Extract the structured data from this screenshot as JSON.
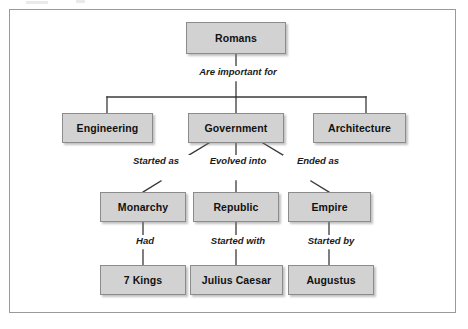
{
  "diagram": {
    "type": "concept-map",
    "title_node": "Romans",
    "frame": {
      "visible": true,
      "border_color": "#9a9a9a"
    },
    "style": {
      "node_fill": "#d2d2d2",
      "node_border": "#8b8b8b",
      "text_color": "#111111",
      "line_color": "#3a3a3a",
      "background": "#ffffff"
    },
    "nodes": [
      {
        "id": "romans",
        "label": "Romans",
        "level": 0
      },
      {
        "id": "engineering",
        "label": "Engineering",
        "level": 1
      },
      {
        "id": "government",
        "label": "Government",
        "level": 1
      },
      {
        "id": "architecture",
        "label": "Architecture",
        "level": 1
      },
      {
        "id": "monarchy",
        "label": "Monarchy",
        "level": 2
      },
      {
        "id": "republic",
        "label": "Republic",
        "level": 2
      },
      {
        "id": "empire",
        "label": "Empire",
        "level": 2
      },
      {
        "id": "seven_kings",
        "label": "7 Kings",
        "level": 3
      },
      {
        "id": "julius",
        "label": "Julius Caesar",
        "level": 3
      },
      {
        "id": "augustus",
        "label": "Augustus",
        "level": 3
      }
    ],
    "edges": [
      {
        "from": "romans",
        "to": "engineering",
        "label": "Are important for"
      },
      {
        "from": "romans",
        "to": "government",
        "label": "Are important for"
      },
      {
        "from": "romans",
        "to": "architecture",
        "label": "Are important for"
      },
      {
        "from": "government",
        "to": "monarchy",
        "label": "Started as"
      },
      {
        "from": "government",
        "to": "republic",
        "label": "Evolved into"
      },
      {
        "from": "government",
        "to": "empire",
        "label": "Ended as"
      },
      {
        "from": "monarchy",
        "to": "seven_kings",
        "label": "Had"
      },
      {
        "from": "republic",
        "to": "julius",
        "label": "Started with"
      },
      {
        "from": "empire",
        "to": "augustus",
        "label": "Started by"
      }
    ],
    "edge_labels": {
      "are_important_for": "Are important for",
      "started_as": "Started as",
      "evolved_into": "Evolved into",
      "ended_as": "Ended as",
      "had": "Had",
      "started_with": "Started with",
      "started_by": "Started by"
    }
  }
}
